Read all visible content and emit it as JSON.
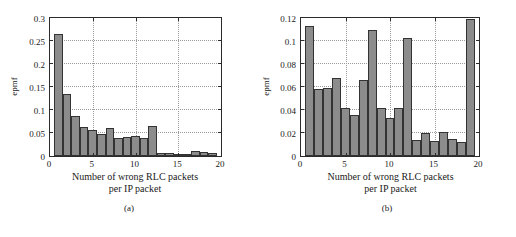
{
  "figure": {
    "panels": [
      {
        "id": "a",
        "subcaption": "(a)",
        "xlabel_line1": "Number of wrong RLC packets",
        "xlabel_line2": "per IP packet",
        "ylabel": "epmf",
        "xticks": [
          "0",
          "5",
          "10",
          "15",
          "20"
        ],
        "yticks": [
          "0",
          "0.05",
          "0.1",
          "0.15",
          "0.2",
          "0.25",
          "0.3"
        ]
      },
      {
        "id": "b",
        "subcaption": "(b)",
        "xlabel_line1": "Number of wrong RLC packets",
        "xlabel_line2": "per IP packet",
        "ylabel": "epmf",
        "xticks": [
          "0",
          "5",
          "10",
          "15",
          "20"
        ],
        "yticks": [
          "0",
          "0.02",
          "0.04",
          "0.06",
          "0.08",
          "0.1",
          "0.12"
        ]
      }
    ],
    "colors": {
      "bar_fill": "#8c8c8c",
      "bar_edge": "#333333",
      "axis": "#2b2b2b",
      "grid": "#9a9a9a",
      "background": "#ffffff"
    }
  },
  "chart_data": [
    {
      "type": "bar",
      "panel": "a",
      "title": "",
      "xlabel": "Number of wrong RLC packets per IP packet",
      "ylabel": "epmf",
      "xlim": [
        0,
        20
      ],
      "ylim": [
        0,
        0.3
      ],
      "xticks": [
        0,
        5,
        10,
        15,
        20
      ],
      "yticks": [
        0,
        0.05,
        0.1,
        0.15,
        0.2,
        0.25,
        0.3
      ],
      "grid": true,
      "legend": null,
      "categories": [
        1,
        2,
        3,
        4,
        5,
        6,
        7,
        8,
        9,
        10,
        11,
        12,
        13,
        14,
        15,
        16,
        17,
        18,
        19
      ],
      "values": [
        0.266,
        0.135,
        0.087,
        0.064,
        0.056,
        0.048,
        0.06,
        0.04,
        0.042,
        0.043,
        0.04,
        0.066,
        0.007,
        0.006,
        0.005,
        0.003,
        0.011,
        0.008,
        0.006
      ]
    },
    {
      "type": "bar",
      "panel": "b",
      "title": "",
      "xlabel": "Number of wrong RLC packets per IP packet",
      "ylabel": "epmf",
      "xlim": [
        0,
        20
      ],
      "ylim": [
        0,
        0.12
      ],
      "xticks": [
        0,
        5,
        10,
        15,
        20
      ],
      "yticks": [
        0,
        0.02,
        0.04,
        0.06,
        0.08,
        0.1,
        0.12
      ],
      "grid": true,
      "legend": null,
      "categories": [
        1,
        2,
        3,
        4,
        5,
        6,
        7,
        8,
        9,
        10,
        11,
        12,
        13,
        14,
        15,
        16,
        17,
        18,
        19
      ],
      "values": [
        0.113,
        0.058,
        0.059,
        0.068,
        0.042,
        0.036,
        0.066,
        0.11,
        0.042,
        0.033,
        0.042,
        0.103,
        0.014,
        0.02,
        0.013,
        0.021,
        0.015,
        0.012,
        0.119
      ]
    }
  ]
}
